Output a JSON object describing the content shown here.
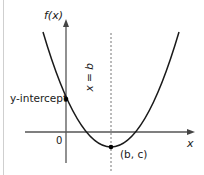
{
  "diagram": {
    "type": "parabola-graph",
    "y_axis_label": "f(x)",
    "x_axis_label": "x",
    "origin_label": "0",
    "y_intercept_label": "y-intercept",
    "axis_of_symmetry_label": "x = b",
    "vertex_label": "(b, c)",
    "colors": {
      "curve": "#1a1a1a",
      "axes": "#555555",
      "dashed_line": "#777777",
      "points": "#000000",
      "border": "#cfcfcf"
    }
  }
}
